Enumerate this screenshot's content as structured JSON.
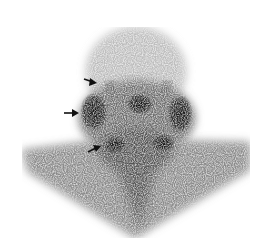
{
  "image": {
    "description": "Salivary gland scintigraphy, anterior view of head and neck",
    "background": "#ffffff",
    "tracer_color": "#1a1a1a",
    "arrows": [
      {
        "name": "arrow-upper",
        "x": 90,
        "y": 80,
        "direction": "right"
      },
      {
        "name": "arrow-middle",
        "x": 70,
        "y": 113,
        "direction": "right"
      },
      {
        "name": "arrow-lower",
        "x": 95,
        "y": 150,
        "direction": "right"
      }
    ]
  }
}
